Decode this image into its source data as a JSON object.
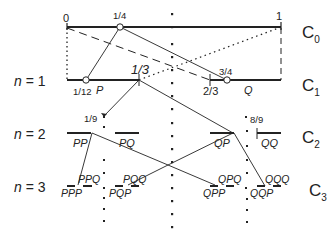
{
  "rows": {
    "n1": "n = 1",
    "n2": "n = 2",
    "n3": "n = 3"
  },
  "levels": {
    "c0": "C",
    "c0_sub": "0",
    "c1": "C",
    "c1_sub": "1",
    "c2": "C",
    "c2_sub": "2",
    "c3": "C",
    "c3_sub": "3"
  },
  "ticks": {
    "zero": "0",
    "one": "1",
    "quarter": "1/4",
    "twelfth": "1/12",
    "third": "1/3",
    "two_thirds": "2/3",
    "three_quarters": "3/4",
    "ninth": "1/9",
    "eight_ninths": "8/9"
  },
  "intervals": {
    "P": "P",
    "Q": "Q",
    "PP": "PP",
    "PQ": "PQ",
    "QP": "QP",
    "QQ": "QQ",
    "PPP": "PPP",
    "PPQ": "PPQ",
    "PQP": "PQP",
    "PQQ": "PQQ",
    "QPP": "QPP",
    "QPQ": "QPQ",
    "QQP": "QQP",
    "QQQ": "QQQ"
  },
  "colors": {
    "stroke": "#222222",
    "background": "#ffffff"
  }
}
